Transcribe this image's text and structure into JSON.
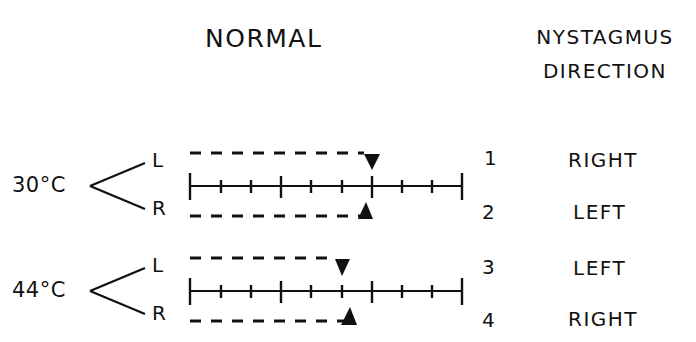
{
  "header": {
    "title": "NORMAL",
    "column_heading_line1": "NYSTAGMUS",
    "column_heading_line2": "DIRECTION"
  },
  "scale": {
    "intervals": 9,
    "major_ticks": [
      0,
      3,
      6,
      9
    ]
  },
  "tests": [
    {
      "temperature": "30°C",
      "ears": [
        {
          "side": "L",
          "number": "1",
          "direction": "RIGHT",
          "marker": "down-triangle",
          "position": 6.0
        },
        {
          "side": "R",
          "number": "2",
          "direction": "LEFT",
          "marker": "up-triangle",
          "position": 5.8
        }
      ]
    },
    {
      "temperature": "44°C",
      "ears": [
        {
          "side": "L",
          "number": "3",
          "direction": "LEFT",
          "marker": "down-triangle",
          "position": 5.0
        },
        {
          "side": "R",
          "number": "4",
          "direction": "RIGHT",
          "marker": "up-triangle",
          "position": 5.2
        }
      ]
    }
  ]
}
